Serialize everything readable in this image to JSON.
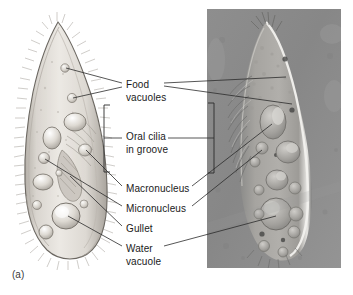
{
  "figure": {
    "panel_letter": "(a)",
    "organism": "Paramecium",
    "panels": [
      {
        "name": "drawing",
        "kind": "illustration"
      },
      {
        "name": "micrograph",
        "kind": "light-micrograph"
      }
    ]
  },
  "labels": [
    {
      "id": "food-vacuoles",
      "line1": "Food",
      "line2": "vacuoles",
      "x": 126,
      "y": 79
    },
    {
      "id": "oral-cilia",
      "line1": "Oral cilia",
      "line2": "in groove",
      "x": 126,
      "y": 131
    },
    {
      "id": "macronucleus",
      "line1": "Macronucleus",
      "line2": "",
      "x": 126,
      "y": 183
    },
    {
      "id": "micronucleus",
      "line1": "Micronucleus",
      "line2": "",
      "x": 126,
      "y": 203
    },
    {
      "id": "gullet",
      "line1": "Gullet",
      "line2": "",
      "x": 126,
      "y": 223
    },
    {
      "id": "water-vacuole",
      "line1": "Water",
      "line2": "vacuole",
      "x": 126,
      "y": 243
    }
  ],
  "colors": {
    "background": "#ffffff",
    "text": "#1a1a1a",
    "leader_line": "#2b2b2b",
    "bracket": "#2b2b2b",
    "cell_body_light": "#e7e3dd",
    "cell_body_mid": "#c9c4bc",
    "cell_body_dark": "#8f8a83",
    "cell_outline": "#6b6761",
    "micrograph_bg": "#8d8d8d",
    "micrograph_cell": "#a9a7a3"
  },
  "geometry": {
    "canvas": {
      "width": 353,
      "height": 295
    },
    "micrograph_rect": {
      "x": 207,
      "y": 9,
      "width": 134,
      "height": 259
    },
    "bracket_left": {
      "x": 104,
      "y_top": 105,
      "y_bottom": 172,
      "tick": 6,
      "stem_y": 138,
      "stem_to_x": 122
    },
    "bracket_right": {
      "x": 214,
      "y_top": 103,
      "y_bottom": 173,
      "tick": 6,
      "stem_y": 138,
      "stem_to_x": 196
    }
  }
}
